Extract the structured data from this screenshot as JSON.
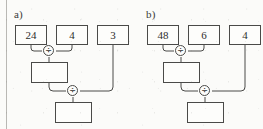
{
  "page": {
    "width": 263,
    "height": 129,
    "background_color": "#fbfbf9",
    "ink_color": "#4a4a48",
    "margin_rule_color": "#b9b8b4"
  },
  "diagrams": [
    {
      "label": "a)",
      "inputs": [
        {
          "value": "24"
        },
        {
          "value": "4"
        },
        {
          "value": "3"
        }
      ],
      "operators": [
        {
          "symbol": "÷",
          "name": "division"
        },
        {
          "symbol": "÷",
          "name": "division"
        }
      ],
      "intermediate_result": {
        "value": ""
      },
      "final_result": {
        "value": ""
      }
    },
    {
      "label": "b)",
      "inputs": [
        {
          "value": "48"
        },
        {
          "value": "6"
        },
        {
          "value": "4"
        }
      ],
      "operators": [
        {
          "symbol": "÷",
          "name": "division"
        },
        {
          "symbol": "÷",
          "name": "division"
        }
      ],
      "intermediate_result": {
        "value": ""
      },
      "final_result": {
        "value": ""
      }
    }
  ]
}
